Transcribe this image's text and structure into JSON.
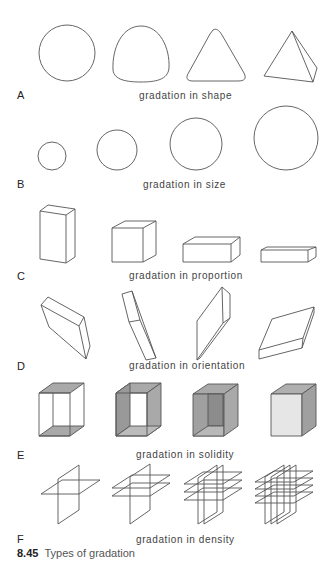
{
  "rows": [
    {
      "letter": "A",
      "caption": "gradation in shape"
    },
    {
      "letter": "B",
      "caption": "gradation in size"
    },
    {
      "letter": "C",
      "caption": "gradation in proportion"
    },
    {
      "letter": "D",
      "caption": "gradation in orientation"
    },
    {
      "letter": "E",
      "caption": "gradation in solidity"
    },
    {
      "letter": "F",
      "caption": "gradation in density"
    }
  ],
  "figure": {
    "number": "8.45",
    "title": "Types of gradation"
  },
  "colors": {
    "stroke": "#555555",
    "face_gray": "#a9a9a9",
    "face_dark": "#8c8c8c",
    "face_light": "#e6e6e6"
  }
}
